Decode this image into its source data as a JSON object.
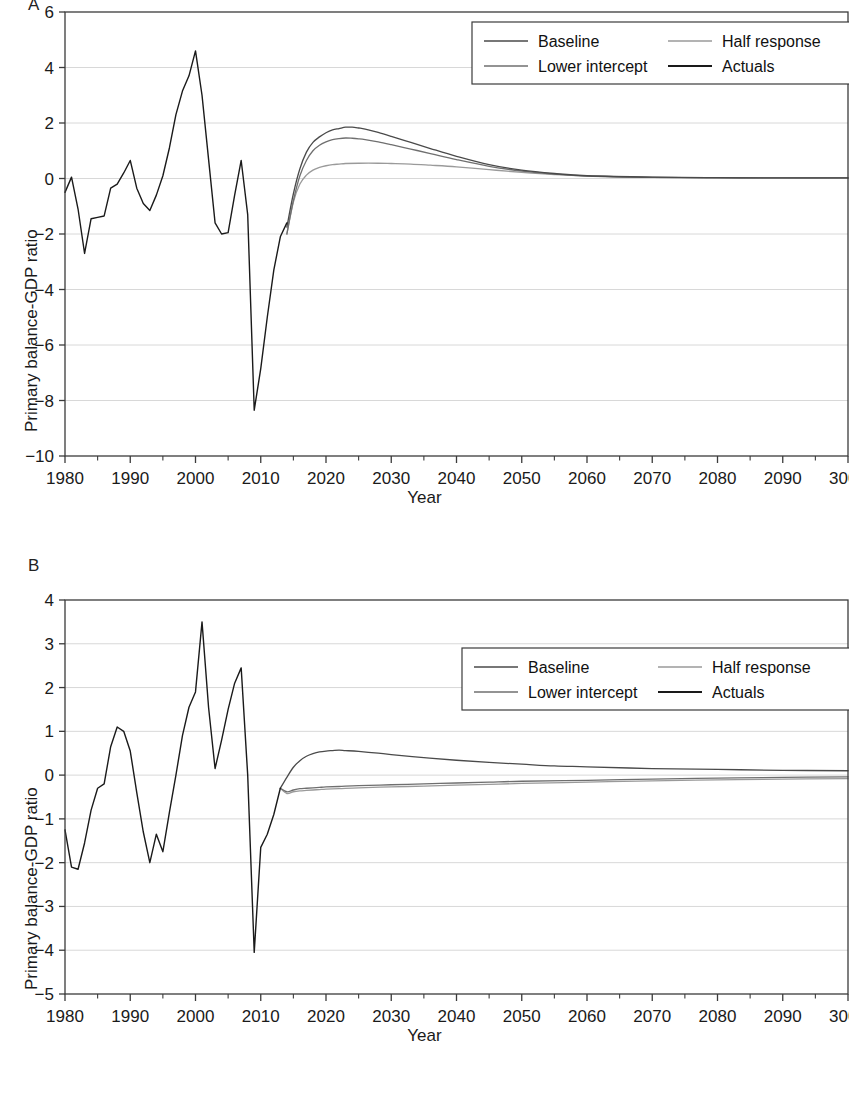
{
  "figure": {
    "panels": [
      {
        "letter": "A",
        "xlabel": "Year",
        "ylabel": "Primary balance-GDP ratio"
      },
      {
        "letter": "B",
        "xlabel": "Year",
        "ylabel": "Primary balance-GDP ratio"
      }
    ]
  },
  "colors": {
    "actuals": "#1a1a1a",
    "baseline": "#4a4a4a",
    "lower_intercept": "#6f6f6f",
    "half_response": "#9a9a9a",
    "axis": "#3b3b3b",
    "grid": "#d8d8d8",
    "background": "#ffffff"
  },
  "chart_data": [
    {
      "type": "line",
      "panel": "A",
      "title": "",
      "xlabel": "Year",
      "ylabel": "Primary balance-GDP ratio",
      "xlim": [
        1980,
        2100
      ],
      "ylim": [
        -10,
        6
      ],
      "xticks": [
        1980,
        1990,
        2000,
        2010,
        2020,
        2030,
        2040,
        2050,
        2060,
        2070,
        2080,
        2090,
        2100
      ],
      "xticklabels": [
        "1980",
        "1990",
        "2000",
        "2010",
        "2020",
        "2030",
        "2040",
        "2050",
        "2060",
        "2070",
        "2080",
        "2090",
        "3000"
      ],
      "yticks": [
        -10,
        -8,
        -6,
        -4,
        -2,
        0,
        2,
        4,
        6
      ],
      "yticklabels": [
        "−10",
        "−8",
        "−6",
        "−4",
        "−2",
        "0",
        "2",
        "4",
        "6"
      ],
      "grid": true,
      "legend_position": "top-right",
      "series": [
        {
          "name": "Actuals",
          "color": "#1a1a1a",
          "x": [
            1980,
            1981,
            1982,
            1983,
            1984,
            1985,
            1986,
            1987,
            1988,
            1989,
            1990,
            1991,
            1992,
            1993,
            1994,
            1995,
            1996,
            1997,
            1998,
            1999,
            2000,
            2001,
            2002,
            2003,
            2004,
            2005,
            2006,
            2007,
            2008,
            2009,
            2010,
            2011,
            2012,
            2013,
            2014
          ],
          "y": [
            -0.5,
            0.05,
            -1.1,
            -2.7,
            -1.45,
            -1.4,
            -1.35,
            -0.35,
            -0.2,
            0.2,
            0.65,
            -0.35,
            -0.9,
            -1.15,
            -0.6,
            0.1,
            1.1,
            2.3,
            3.15,
            3.7,
            4.6,
            3.0,
            0.7,
            -1.6,
            -2.0,
            -1.95,
            -0.6,
            0.65,
            -1.3,
            -8.35,
            -6.85,
            -5.0,
            -3.3,
            -2.1,
            -1.6
          ]
        },
        {
          "name": "Baseline",
          "color": "#4a4a4a",
          "x": [
            2014,
            2015,
            2016,
            2017,
            2018,
            2019,
            2020,
            2021,
            2022,
            2023,
            2024,
            2025,
            2026,
            2028,
            2030,
            2033,
            2036,
            2040,
            2045,
            2050,
            2055,
            2060,
            2070,
            2080,
            2090,
            2100
          ],
          "y": [
            -1.75,
            -0.55,
            0.35,
            0.95,
            1.3,
            1.5,
            1.65,
            1.75,
            1.8,
            1.85,
            1.85,
            1.82,
            1.78,
            1.66,
            1.52,
            1.3,
            1.08,
            0.8,
            0.5,
            0.3,
            0.18,
            0.1,
            0.05,
            0.03,
            0.02,
            0.02
          ]
        },
        {
          "name": "Lower intercept",
          "color": "#6f6f6f",
          "x": [
            2014,
            2015,
            2016,
            2017,
            2018,
            2019,
            2020,
            2021,
            2022,
            2023,
            2024,
            2025,
            2026,
            2028,
            2030,
            2033,
            2036,
            2040,
            2045,
            2050,
            2055,
            2060,
            2070,
            2080,
            2090,
            2100
          ],
          "y": [
            -2.0,
            -0.8,
            0.1,
            0.65,
            1.0,
            1.2,
            1.32,
            1.4,
            1.44,
            1.46,
            1.45,
            1.43,
            1.4,
            1.32,
            1.22,
            1.06,
            0.9,
            0.68,
            0.44,
            0.27,
            0.16,
            0.09,
            0.04,
            0.02,
            0.02,
            0.02
          ]
        },
        {
          "name": "Half response",
          "color": "#9a9a9a",
          "x": [
            2014,
            2015,
            2016,
            2017,
            2018,
            2019,
            2020,
            2021,
            2022,
            2023,
            2025,
            2028,
            2030,
            2033,
            2036,
            2040,
            2045,
            2050,
            2055,
            2060,
            2070,
            2080,
            2090,
            2100
          ],
          "y": [
            -2.0,
            -0.85,
            -0.2,
            0.12,
            0.3,
            0.4,
            0.46,
            0.5,
            0.52,
            0.54,
            0.55,
            0.55,
            0.54,
            0.52,
            0.48,
            0.42,
            0.32,
            0.22,
            0.14,
            0.09,
            0.04,
            0.02,
            0.01,
            0.01
          ]
        }
      ]
    },
    {
      "type": "line",
      "panel": "B",
      "title": "",
      "xlabel": "Year",
      "ylabel": "Primary balance-GDP ratio",
      "xlim": [
        1980,
        2100
      ],
      "ylim": [
        -5,
        4
      ],
      "xticks": [
        1980,
        1990,
        2000,
        2010,
        2020,
        2030,
        2040,
        2050,
        2060,
        2070,
        2080,
        2090,
        2100
      ],
      "xticklabels": [
        "1980",
        "1990",
        "2000",
        "2010",
        "2020",
        "2030",
        "2040",
        "2050",
        "2060",
        "2070",
        "2080",
        "2090",
        "3000"
      ],
      "yticks": [
        -5,
        -4,
        -3,
        -2,
        -1,
        0,
        1,
        2,
        3,
        4
      ],
      "yticklabels": [
        "−5",
        "−4",
        "−3",
        "−2",
        "−1",
        "0",
        "1",
        "2",
        "3",
        "4"
      ],
      "grid": true,
      "legend_position": "top-right",
      "series": [
        {
          "name": "Actuals",
          "color": "#1a1a1a",
          "x": [
            1980,
            1981,
            1982,
            1983,
            1984,
            1985,
            1986,
            1987,
            1988,
            1989,
            1990,
            1991,
            1992,
            1993,
            1994,
            1995,
            1996,
            1997,
            1998,
            1999,
            2000,
            2001,
            2002,
            2003,
            2004,
            2005,
            2006,
            2007,
            2008,
            2009,
            2010,
            2011,
            2012,
            2013
          ],
          "y": [
            -1.25,
            -2.1,
            -2.15,
            -1.55,
            -0.8,
            -0.3,
            -0.2,
            0.65,
            1.1,
            1.0,
            0.55,
            -0.4,
            -1.3,
            -2.0,
            -1.35,
            -1.75,
            -0.85,
            0.0,
            0.9,
            1.55,
            1.9,
            3.5,
            1.55,
            0.15,
            0.8,
            1.5,
            2.1,
            2.45,
            0.0,
            -4.05,
            -1.65,
            -1.35,
            -0.9,
            -0.3
          ]
        },
        {
          "name": "Baseline",
          "color": "#4a4a4a",
          "x": [
            2013,
            2014,
            2015,
            2016,
            2017,
            2018,
            2019,
            2020,
            2021,
            2022,
            2023,
            2025,
            2028,
            2030,
            2035,
            2040,
            2045,
            2050,
            2055,
            2060,
            2070,
            2080,
            2090,
            2100
          ],
          "y": [
            -0.3,
            -0.05,
            0.18,
            0.33,
            0.43,
            0.49,
            0.53,
            0.55,
            0.56,
            0.57,
            0.56,
            0.54,
            0.5,
            0.47,
            0.4,
            0.34,
            0.29,
            0.25,
            0.21,
            0.19,
            0.15,
            0.13,
            0.11,
            0.1
          ]
        },
        {
          "name": "Lower intercept",
          "color": "#6f6f6f",
          "x": [
            2013,
            2014,
            2015,
            2016,
            2017,
            2018,
            2019,
            2020,
            2022,
            2025,
            2030,
            2035,
            2040,
            2045,
            2050,
            2060,
            2070,
            2080,
            2090,
            2100
          ],
          "y": [
            -0.3,
            -0.38,
            -0.34,
            -0.31,
            -0.3,
            -0.29,
            -0.28,
            -0.27,
            -0.26,
            -0.24,
            -0.22,
            -0.2,
            -0.18,
            -0.16,
            -0.14,
            -0.12,
            -0.09,
            -0.07,
            -0.05,
            -0.04
          ]
        },
        {
          "name": "Half response",
          "color": "#9a9a9a",
          "x": [
            2013,
            2014,
            2015,
            2016,
            2017,
            2018,
            2019,
            2020,
            2022,
            2025,
            2030,
            2035,
            2040,
            2045,
            2050,
            2060,
            2070,
            2080,
            2090,
            2100
          ],
          "y": [
            -0.3,
            -0.42,
            -0.38,
            -0.36,
            -0.35,
            -0.34,
            -0.33,
            -0.32,
            -0.31,
            -0.29,
            -0.27,
            -0.25,
            -0.23,
            -0.21,
            -0.19,
            -0.16,
            -0.13,
            -0.11,
            -0.09,
            -0.08
          ]
        }
      ],
      "legend": [
        "Baseline",
        "Half response",
        "Lower intercept",
        "Actuals"
      ]
    }
  ]
}
